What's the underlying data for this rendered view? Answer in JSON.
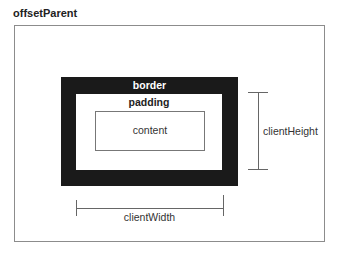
{
  "diagram": {
    "title": "offsetParent",
    "labels": {
      "border": "border",
      "padding": "padding",
      "content": "content",
      "client_width": "clientWidth",
      "client_height": "clientHeight"
    },
    "colors": {
      "border_fill": "#1a1a1a",
      "outline": "#8c8c8c",
      "measure_line": "#666666",
      "background": "#ffffff"
    }
  }
}
